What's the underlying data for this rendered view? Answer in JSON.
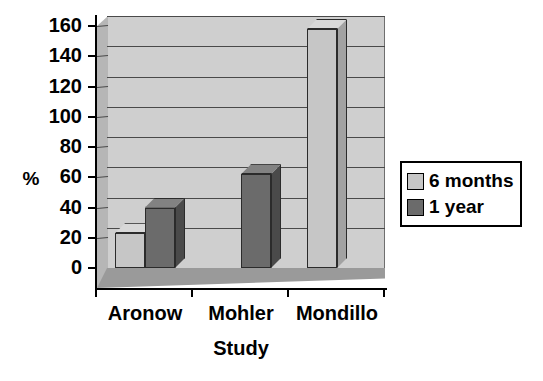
{
  "chart_data": {
    "type": "bar",
    "title": "",
    "subtitle": "",
    "xlabel": "Study",
    "ylabel": "%",
    "categories": [
      "Aronow",
      "Mohler",
      "Mondillo"
    ],
    "series": [
      {
        "name": "6 months",
        "color": "#c6c6c6",
        "values": [
          23,
          0,
          158
        ]
      },
      {
        "name": "1 year",
        "color": "#6b6b6b",
        "values": [
          40,
          62,
          0
        ]
      }
    ],
    "ylim": [
      0,
      160
    ],
    "ytick_step": 20,
    "ytick_labels": [
      "0",
      "20",
      "40",
      "60",
      "80",
      "100",
      "120",
      "140",
      "160"
    ],
    "grid": true,
    "grid_axis": "y",
    "legend_position": "right",
    "style": "3d-column",
    "background": "#cfcfcf",
    "floor_color": "#9a9a9a",
    "wall_color": "#b6b6b6"
  },
  "legend": {
    "entries": [
      {
        "label": "6 months",
        "swatch": "light-gray-swatch-icon"
      },
      {
        "label": "1 year",
        "swatch": "dark-gray-swatch-icon"
      }
    ]
  }
}
